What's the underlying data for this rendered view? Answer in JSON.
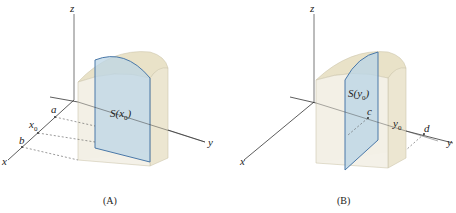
{
  "figure": {
    "panels": [
      {
        "id": "A",
        "caption": "(A)",
        "axes": {
          "x": "x",
          "y": "y",
          "z": "z"
        },
        "labels": {
          "a": "a",
          "x0_base": "x",
          "x0_sub": "0",
          "b": "b"
        },
        "cross_section": {
          "base": "S(x",
          "sub": "0",
          "close": ")"
        }
      },
      {
        "id": "B",
        "caption": "(B)",
        "axes": {
          "x": "x",
          "y": "y",
          "z": "z"
        },
        "labels": {
          "c": "c",
          "y0_base": "y",
          "y0_sub": "0",
          "d": "d"
        },
        "cross_section": {
          "base": "S(y",
          "sub": "0",
          "close": ")"
        }
      }
    ],
    "colors": {
      "solid_fill": "#efeadb",
      "solid_edge": "#c9c2a8",
      "slice_fill": "#bcd6e6",
      "slice_edge": "#4a78a8",
      "axis": "#333333"
    }
  }
}
